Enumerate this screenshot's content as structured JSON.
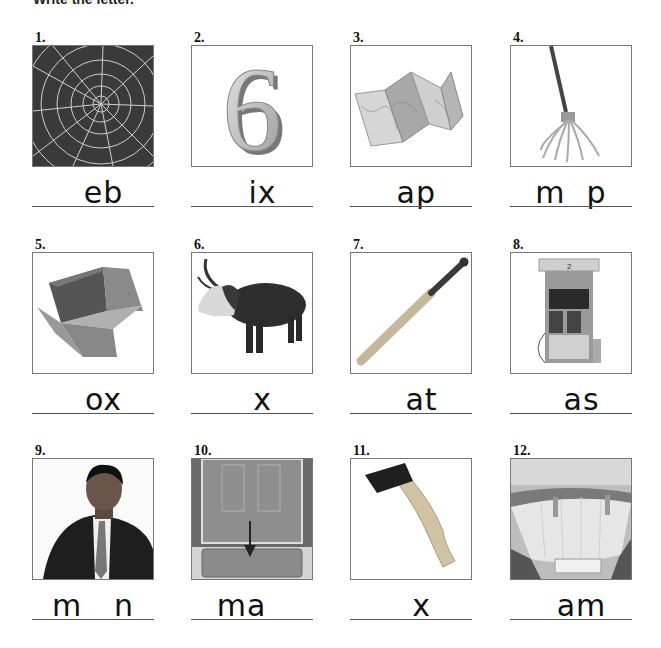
{
  "header": {
    "instruction": "Write the letter."
  },
  "items": [
    {
      "number": "1.",
      "picture": "spider-web",
      "word_fragment": "  eb"
    },
    {
      "number": "2.",
      "picture": "number-six",
      "word_fragment": "  ix"
    },
    {
      "number": "3.",
      "picture": "folded-map",
      "word_fragment": " ap"
    },
    {
      "number": "4.",
      "picture": "mop",
      "word_fragment": "m  p"
    },
    {
      "number": "5.",
      "picture": "box",
      "word_fragment": "  ox"
    },
    {
      "number": "6.",
      "picture": "ox",
      "word_fragment": "  x"
    },
    {
      "number": "7.",
      "picture": "baseball-bat",
      "word_fragment": "  at"
    },
    {
      "number": "8.",
      "picture": "gas-pump",
      "word_fragment": "  as"
    },
    {
      "number": "9.",
      "picture": "man",
      "word_fragment": "m   n"
    },
    {
      "number": "10.",
      "picture": "doormat",
      "word_fragment": "ma  "
    },
    {
      "number": "11.",
      "picture": "ax",
      "word_fragment": "  x"
    },
    {
      "number": "12.",
      "picture": "dam",
      "word_fragment": "  am"
    }
  ]
}
